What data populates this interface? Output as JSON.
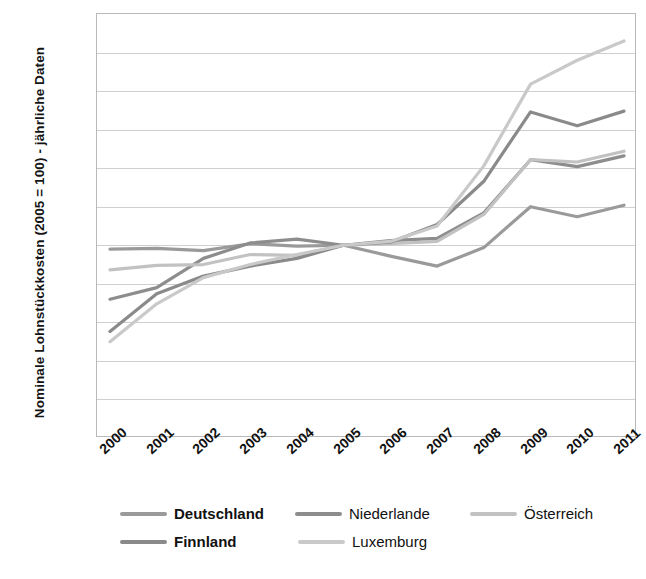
{
  "chart_data": {
    "type": "line",
    "title": "",
    "xlabel": "",
    "ylabel": "Nominale Lohnstückkosten (2005 = 100) - jährliche Daten",
    "categories": [
      "2000",
      "2001",
      "2002",
      "2003",
      "2004",
      "2005",
      "2006",
      "2007",
      "2008",
      "2009",
      "2010",
      "2011"
    ],
    "ylim": [
      75,
      130
    ],
    "ytick_step": 5,
    "yticks": [
      75,
      80,
      85,
      90,
      95,
      100,
      105,
      110,
      115,
      120,
      125,
      130
    ],
    "grid": true,
    "legend_position": "bottom",
    "series": [
      {
        "name": "Deutschland",
        "color": "#9a9a9a",
        "values": [
          99.5,
          99.6,
          99.3,
          100.2,
          99.9,
          100.0,
          98.6,
          97.3,
          99.7,
          105.0,
          103.7,
          105.2
        ]
      },
      {
        "name": "Niederlande",
        "color": "#8d8d8d",
        "values": [
          93.0,
          94.5,
          98.3,
          100.3,
          100.8,
          100.0,
          100.6,
          100.9,
          104.2,
          111.1,
          110.2,
          111.6
        ]
      },
      {
        "name": "Österreich",
        "color": "#c2c2c2",
        "values": [
          96.8,
          97.4,
          97.5,
          98.8,
          98.7,
          100.0,
          100.2,
          100.5,
          104.0,
          111.1,
          110.8,
          112.2
        ]
      },
      {
        "name": "Finnland",
        "color": "#8a8a8a",
        "values": [
          88.8,
          93.7,
          96.0,
          97.3,
          98.3,
          100.0,
          100.4,
          102.7,
          108.3,
          117.3,
          115.5,
          117.4
        ]
      },
      {
        "name": "Luxemburg",
        "color": "#c9c9c9",
        "values": [
          87.5,
          92.4,
          95.8,
          97.5,
          98.8,
          100.0,
          100.5,
          102.5,
          110.3,
          120.9,
          124.0,
          126.5
        ]
      }
    ]
  },
  "legend": {
    "row1": [
      {
        "label": "Deutschland",
        "color": "#9a9a9a",
        "bold": true
      },
      {
        "label": "Niederlande",
        "color": "#8d8d8d",
        "bold": false
      },
      {
        "label": "Österreich",
        "color": "#c2c2c2",
        "bold": false
      }
    ],
    "row2": [
      {
        "label": "Finnland",
        "color": "#8a8a8a",
        "bold": true
      },
      {
        "label": "Luxemburg",
        "color": "#c9c9c9",
        "bold": false
      }
    ]
  }
}
